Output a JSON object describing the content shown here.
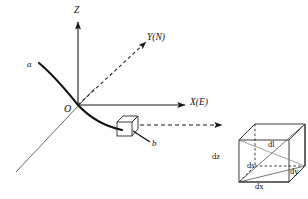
{
  "figure": {
    "background_color": "#ffffff",
    "stroke_color": "#1a1a1a",
    "width": 308,
    "height": 199
  },
  "axes": {
    "z": {
      "label": "Z",
      "style": "solid",
      "direction": "up"
    },
    "y": {
      "label": "Y(N)",
      "style": "dashed",
      "direction": "up-right"
    },
    "x": {
      "label": "X(E)",
      "style": "solid",
      "direction": "right"
    },
    "origin": {
      "label": "O"
    }
  },
  "trajectory": {
    "start_label": "a",
    "end_label": "b",
    "style": "solid-thick",
    "marker": "sensor-box"
  },
  "connector": {
    "style": "dashed",
    "arrowhead": true
  },
  "cube": {
    "name": "differential-volume-element",
    "labels": {
      "dx": "dx",
      "dy": "dy",
      "dz": "dz",
      "ds": "ds",
      "dl": "dl"
    }
  }
}
